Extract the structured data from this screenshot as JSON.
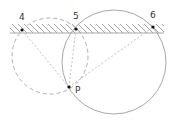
{
  "diagram": {
    "colors": {
      "stroke": "#a8a8a8",
      "dashed": "#b0b0b0",
      "dotted": "#c4c4c4",
      "point": "#111111",
      "text": "#333333"
    },
    "points": [
      {
        "id": "4",
        "label": "4"
      },
      {
        "id": "5",
        "label": "5"
      },
      {
        "id": "6",
        "label": "6"
      },
      {
        "id": "P",
        "label": "P"
      }
    ],
    "circles": [
      {
        "id": "dashed-circle",
        "through": [
          "4",
          "5",
          "P"
        ],
        "style": "dashed"
      },
      {
        "id": "solid-circle",
        "through": [
          "5",
          "6",
          "P"
        ],
        "style": "solid"
      }
    ],
    "segments": [
      {
        "from": "P",
        "to": "4",
        "style": "dotted"
      },
      {
        "from": "P",
        "to": "5",
        "style": "dotted"
      },
      {
        "from": "P",
        "to": "6",
        "style": "dotted"
      }
    ],
    "boundary": {
      "style": "hatched",
      "side": "above"
    }
  }
}
